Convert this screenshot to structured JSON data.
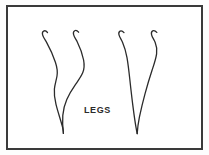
{
  "figure": {
    "caption": "LEGS",
    "background_color": "#ffffff",
    "frame_color": "#3a3a3a",
    "stroke_color": "#2b2b2b",
    "frame": {
      "x": 6,
      "y": 5,
      "width": 197,
      "height": 145,
      "border_width": 2
    },
    "groups": [
      {
        "name": "left-leg-pair",
        "label": "left pair of legs",
        "strokes": [
          {
            "name": "left-leg-outer",
            "path": "M 31.5 18.5 C 28.8 15.2 25.6 17.2 26.6 20.8 C 27.2 23.2 29.0 25.6 30.6 28.4 C 34.0 34.6 37.0 41.0 39.4 48.2 C 41.0 53.0 41.8 57.4 41.0 62.0 C 40.2 66.6 38.8 70.6 38.4 75.0 C 38.0 80.0 38.6 85.0 40.0 90.4 C 41.8 97.6 44.2 104.6 46.2 111.8 C 47.0 114.8 47.6 117.4 47.4 119.4",
            "stroke_width": 1.3
          },
          {
            "name": "left-leg-inner",
            "path": "M 62.6 18.2 C 59.8 14.8 56.6 16.8 57.6 20.6 C 58.2 23.0 60.0 25.4 61.4 28.2 C 64.2 33.8 66.4 39.6 67.6 46.0 C 68.4 50.4 68.4 54.6 66.8 58.6 C 65.0 63.0 62.2 66.6 59.4 70.6 C 56.2 75.2 53.2 80.0 50.8 85.4 C 48.4 90.8 47.2 96.0 46.8 101.4 C 46.4 107.4 46.6 113.4 47.4 119.4",
            "stroke_width": 1.3
          }
        ]
      },
      {
        "name": "right-leg-pair",
        "label": "right pair of legs",
        "strokes": [
          {
            "name": "right-leg-outer",
            "path": "M 108.0 18.6 C 105.2 15.2 102.0 17.2 103.0 20.9 C 103.6 23.3 105.4 25.6 106.6 28.4 C 108.6 33.0 110.0 38.0 111.0 43.6 C 112.2 50.6 113.0 57.8 113.8 65.2 C 114.8 74.4 115.8 83.6 117.0 92.6 C 118.0 100.4 119.0 108.0 120.2 114.4 C 120.6 116.8 121.0 118.6 121.2 119.6",
            "stroke_width": 1.3
          },
          {
            "name": "right-leg-inner",
            "path": "M 140.8 18.4 C 137.8 15.0 134.6 17.0 135.6 20.8 C 136.2 23.2 138.0 25.6 139.2 28.4 C 140.6 31.8 141.2 35.6 140.6 39.8 C 139.8 45.2 138.0 50.4 136.2 55.8 C 133.6 63.8 131.2 71.8 129.0 79.8 C 126.8 87.8 125.0 95.6 123.4 103.2 C 122.4 108.2 121.6 113.2 121.2 119.6",
            "stroke_width": 1.3
          }
        ]
      }
    ]
  }
}
